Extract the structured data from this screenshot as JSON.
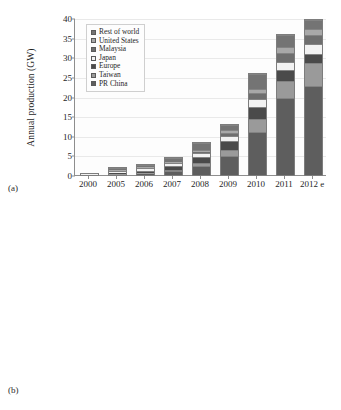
{
  "figure": {
    "panel_a_label": "(a)",
    "panel_b_label": "(b)"
  },
  "chart_data": [
    {
      "id": "a",
      "type": "bar",
      "stacked": true,
      "title": "",
      "xlabel": "",
      "ylabel": "Annual production (GW)",
      "ylim": [
        0,
        40
      ],
      "ytick_step": 5,
      "yticks": [
        "0",
        "5",
        "10",
        "15",
        "20",
        "25",
        "30",
        "35",
        "40"
      ],
      "grid": true,
      "legend_position": "top-left",
      "categories": [
        "2000",
        "2005",
        "2006",
        "2007",
        "2008",
        "2009",
        "2010",
        "2011",
        "2012 e"
      ],
      "series": [
        {
          "name": "PR China",
          "color": "#5e5e5e",
          "values": [
            0.03,
            0.1,
            0.3,
            0.9,
            2.2,
            4.9,
            11.0,
            19.6,
            22.8
          ]
        },
        {
          "name": "Taiwan",
          "color": "#9a9a9a",
          "values": [
            0.01,
            0.05,
            0.15,
            0.4,
            0.8,
            1.6,
            3.2,
            4.3,
            5.8
          ]
        },
        {
          "name": "Europe",
          "color": "#4a4a4a",
          "values": [
            0.06,
            0.3,
            0.55,
            0.9,
            1.5,
            2.1,
            3.1,
            2.8,
            2.3
          ]
        },
        {
          "name": "Japan",
          "color": "#f2f2f2",
          "values": [
            0.12,
            0.6,
            0.75,
            0.8,
            1.0,
            1.3,
            2.1,
            2.1,
            2.4
          ]
        },
        {
          "name": "Malaysia",
          "color": "#6e6e6e",
          "values": [
            0.0,
            0.02,
            0.05,
            0.1,
            0.3,
            0.7,
            1.4,
            2.2,
            2.4
          ]
        },
        {
          "name": "United States",
          "color": "#a8a8a8",
          "values": [
            0.04,
            0.15,
            0.2,
            0.3,
            0.5,
            0.8,
            1.2,
            1.6,
            1.6
          ]
        },
        {
          "name": "Rest of world",
          "color": "#747474",
          "values": [
            0.02,
            0.6,
            0.5,
            0.9,
            1.9,
            1.4,
            3.7,
            3.2,
            2.1
          ]
        }
      ],
      "totals": [
        0.28,
        1.82,
        2.5,
        4.3,
        8.2,
        12.8,
        25.7,
        35.8,
        39.4
      ]
    },
    {
      "id": "b",
      "type": "bar",
      "stacked": true,
      "title": "",
      "xlabel": "",
      "ylabel": "Cumulative photovoltaic\ninstallations  (MWp)",
      "ylim": [
        0,
        100000
      ],
      "ytick_step": 10000,
      "yticks": [
        "0",
        "10,000",
        "20,000",
        "30,000",
        "40,000",
        "50,000",
        "60,000",
        "70,000",
        "80,000",
        "90,000",
        "100,000"
      ],
      "grid": true,
      "legend_position": "top-left",
      "categories": [
        "2000",
        "2005",
        "2006",
        "2007",
        "2008",
        "2009",
        "2010",
        "2011",
        "2012 e"
      ],
      "series": [
        {
          "name": "Japan",
          "color": "#3f3f3f",
          "values": [
            330,
            1420,
            1710,
            1920,
            2150,
            2630,
            3620,
            4910,
            9100
          ]
        },
        {
          "name": "United States",
          "color": "#d2d2d2",
          "values": [
            140,
            480,
            620,
            840,
            1170,
            1620,
            2530,
            4380,
            7800
          ]
        },
        {
          "name": "China",
          "color": "#6a6a6a",
          "values": [
            20,
            70,
            80,
            100,
            145,
            300,
            800,
            3100,
            8300
          ]
        },
        {
          "name": "Rest of world",
          "color": "#4f4f4f",
          "values": [
            90,
            520,
            640,
            860,
            1250,
            1900,
            3500,
            7200,
            9500
          ]
        },
        {
          "name": "Germany",
          "color": "#e0e0e0",
          "values": [
            110,
            2050,
            2900,
            4170,
            6120,
            9800,
            17300,
            24800,
            32000
          ]
        },
        {
          "name": "Spain",
          "color": "#f0f0f0",
          "values": [
            10,
            60,
            160,
            700,
            3400,
            3500,
            3800,
            4200,
            4500
          ]
        },
        {
          "name": "Italy",
          "color": "#636363",
          "values": [
            20,
            38,
            50,
            120,
            460,
            1160,
            3500,
            12800,
            16400
          ]
        },
        {
          "name": "Rest of Europe",
          "color": "#eaeaea",
          "values": [
            30,
            140,
            200,
            330,
            600,
            1600,
            8000,
            10000,
            13400
          ]
        }
      ],
      "totals": [
        750,
        4778,
        6360,
        9040,
        15295,
        22510,
        43050,
        71390,
        101000
      ]
    }
  ]
}
